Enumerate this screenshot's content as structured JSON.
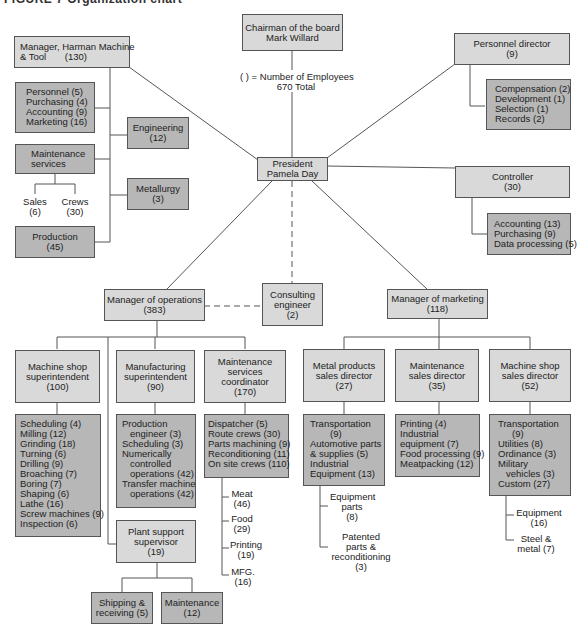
{
  "caption": "FIGURE 7   Organization chart",
  "legend": {
    "line1": "(    ) = Number of Employees",
    "line2": "670 Total"
  },
  "chairman": {
    "title": "Chairman of the board",
    "name": "Mark Willard"
  },
  "president": {
    "title": "President",
    "name": "Pamela Day"
  },
  "harman": {
    "title": "Manager, Harman Machine",
    "title2": "& Tool",
    "count": "(130)",
    "staff": [
      "Personnel (5)",
      "Purchasing (4)",
      "Accounting (9)",
      "Marketing (16)"
    ],
    "engineering": {
      "title": "Engineering",
      "count": "(12)"
    },
    "maintenance": {
      "title": "Maintenance",
      "title2": "services"
    },
    "sales": {
      "title": "Sales",
      "count": "(6)"
    },
    "crews": {
      "title": "Crews",
      "count": "(30)"
    },
    "metallurgy": {
      "title": "Metallurgy",
      "count": "(3)"
    },
    "production": {
      "title": "Production",
      "count": "(45)"
    }
  },
  "personnel": {
    "title": "Personnel director",
    "count": "(9)",
    "items": [
      "Compensation (2)",
      "Development (1)",
      "Selection (1)",
      "Records (2)"
    ]
  },
  "controller": {
    "title": "Controller",
    "count": "(30)",
    "items": [
      "Accounting (13)",
      "Purchasing (9)",
      "Data processing (5)"
    ]
  },
  "consulting": {
    "title": "Consulting",
    "title2": "engineer",
    "count": "(2)"
  },
  "operations": {
    "title": "Manager of operations",
    "count": "(383)",
    "machine_shop": {
      "title": "Machine shop",
      "title2": "superintendent",
      "count": "(100)",
      "items": [
        "Scheduling (4)",
        "Milling (12)",
        "Grinding (18)",
        "Turning (6)",
        "Drilling (9)",
        "Broaching (7)",
        "Boring (7)",
        "Shaping (6)",
        "Lathe (16)",
        "Screw machines (9)",
        "Inspection (6)"
      ]
    },
    "manufacturing": {
      "title": "Manufacturing",
      "title2": "superintendent",
      "count": "(90)",
      "items": [
        "Production",
        "engineer (3)",
        "Scheduling (3)",
        "Numerically",
        "controlled",
        "operations (42)",
        "Transfer machine",
        "operations (42)"
      ]
    },
    "maint_coord": {
      "title": "Maintenance",
      "title2": "services",
      "title3": "coordinator",
      "count": "(170)",
      "items": [
        "Dispatcher (5)",
        "Route crews (30)",
        "Parts machining (9)",
        "Reconditioning (11)",
        "On site crews (110)"
      ],
      "subs": [
        {
          "title": "Meat",
          "count": "(46)"
        },
        {
          "title": "Food",
          "count": "(29)"
        },
        {
          "title": "Printing",
          "count": "(19)"
        },
        {
          "title": "MFG.",
          "count": "(16)"
        }
      ]
    },
    "plant_support": {
      "title": "Plant support",
      "title2": "supervisor",
      "count": "(19)",
      "shipping": {
        "title": "Shipping &",
        "title2": "receiving (5)"
      },
      "maintenance": {
        "title": "Maintenance",
        "count": "(12)"
      }
    }
  },
  "marketing": {
    "title": "Manager of marketing",
    "count": "(118)",
    "metal": {
      "title": "Metal products",
      "title2": "sales director",
      "count": "(27)",
      "items": [
        "Transportation",
        "(9)",
        "Automotive parts",
        "& supplies (5)",
        "Industrial",
        "Equipment (13)"
      ],
      "subs": [
        {
          "l1": "Equipment",
          "l2": "parts",
          "l3": "(8)"
        },
        {
          "l1": "Patented",
          "l2": "parts &",
          "l3": "reconditioning",
          "l4": "(3)"
        }
      ]
    },
    "maint_sales": {
      "title": "Maintenance",
      "title2": "sales director",
      "count": "(35)",
      "items": [
        "Printing (4)",
        "Industrial",
        "equipment (7)",
        "Food processing (9)",
        "Meatpacking (12)"
      ]
    },
    "machine_sales": {
      "title": "Machine shop",
      "title2": "sales director",
      "count": "(52)",
      "items": [
        "Transportation",
        "(9)",
        "Utilities (8)",
        "Ordinance (3)",
        "Military",
        "vehicles (3)",
        "Custom (27)"
      ],
      "subs": [
        {
          "l1": "Equipment",
          "l2": "(16)"
        },
        {
          "l1": "Steel &",
          "l2": "metal (7)"
        }
      ]
    }
  }
}
